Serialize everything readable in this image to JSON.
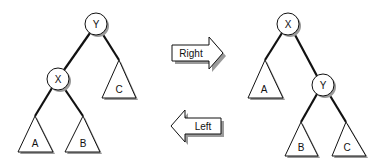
{
  "diagram": {
    "left_tree": {
      "root": "Y",
      "child": "X",
      "subtrees": [
        "A",
        "B",
        "C"
      ]
    },
    "right_tree": {
      "root": "X",
      "child": "Y",
      "subtrees": [
        "A",
        "B",
        "C"
      ]
    },
    "arrows": {
      "right_label": "Right",
      "left_label": "Left"
    },
    "colors": {
      "stroke": "#111111",
      "fill": "#ffffff",
      "shadow": "#9a9a9a"
    }
  }
}
